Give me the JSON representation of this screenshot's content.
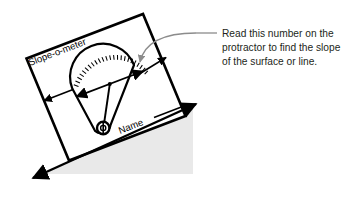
{
  "figure": {
    "background_color": "#ffffff",
    "ground_fill": "#e8e8e8",
    "ink_color": "#000000",
    "leader_color": "#8c8c8c",
    "text_color": "#231f20"
  },
  "annotation": {
    "lines": [
      "Read this number on the",
      "protractor to find the slope",
      "of the surface or line."
    ],
    "leader_icon": "curved-leader-line"
  },
  "device": {
    "name_label": "Slope-o-meter",
    "signature_label": "Name",
    "signature_rule": "signature-line",
    "pivot_icon": "plumb-bob-pivot",
    "arc_icon": "protractor-arc-ticks",
    "tick_count": 24,
    "arrow_icons": [
      "arrow-left-width",
      "arrow-right-width",
      "arrow-card-left-edge",
      "arrow-reading-point"
    ]
  },
  "ground": {
    "slope_icon": "double-arrow-slope-line",
    "fill_label": "shaded-ground-wedge"
  }
}
